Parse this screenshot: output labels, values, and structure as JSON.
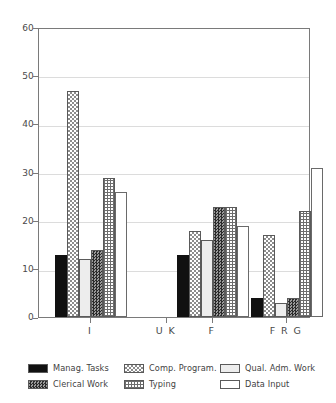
{
  "chart_data": {
    "type": "bar",
    "title": "",
    "subtitle": "",
    "xlabel": "",
    "ylabel": "",
    "ylim": [
      0,
      60
    ],
    "yticks": [
      0,
      10,
      20,
      30,
      40,
      50,
      60
    ],
    "categories": [
      "I",
      "U K",
      "F",
      "F R G"
    ],
    "grid": true,
    "legend_position": "bottom",
    "series": [
      {
        "name": "Manag. Tasks",
        "key": "manag",
        "pattern": "solid-black",
        "values": [
          13,
          0,
          13,
          4
        ]
      },
      {
        "name": "Comp. Program.",
        "key": "comp",
        "pattern": "checker-light",
        "values": [
          47,
          0,
          18,
          17
        ]
      },
      {
        "name": "Qual. Adm. Work",
        "key": "qual",
        "pattern": "light-gray",
        "values": [
          12,
          0,
          16,
          3
        ]
      },
      {
        "name": "Clerical Work",
        "key": "cler",
        "pattern": "checker-dark",
        "values": [
          14,
          0,
          23,
          4
        ]
      },
      {
        "name": "Typing",
        "key": "typ",
        "pattern": "crosshatch",
        "values": [
          29,
          0,
          23,
          22
        ]
      },
      {
        "name": "Data Input",
        "key": "data",
        "pattern": "white-outline",
        "values": [
          26,
          0,
          19,
          31
        ]
      }
    ]
  },
  "axis": {
    "y_tick_labels": [
      "60",
      "50",
      "40",
      "30",
      "20",
      "10",
      "0"
    ],
    "x_tick_labels": [
      "I",
      "U K",
      "F",
      "F R G"
    ]
  },
  "legend": {
    "items": [
      {
        "label": "Manag. Tasks"
      },
      {
        "label": "Comp. Program."
      },
      {
        "label": "Qual. Adm. Work"
      },
      {
        "label": "Clerical Work"
      },
      {
        "label": "Typing"
      },
      {
        "label": "Data Input"
      }
    ]
  },
  "colors": {
    "frame": "#7a7a7a",
    "grid": "#dcdcdc",
    "text": "#444444",
    "solid_black": "#111111",
    "light_gray": "#ededed",
    "white": "#ffffff"
  }
}
